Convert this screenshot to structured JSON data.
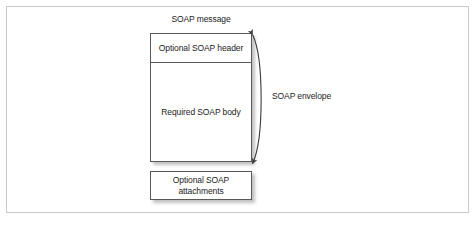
{
  "figure": {
    "title": "SOAP message",
    "side_label": "SOAP envelope",
    "boxes": {
      "header": "Optional SOAP header",
      "body": "Required SOAP body",
      "attachments_line1": "Optional SOAP",
      "attachments_line2": "attachments"
    },
    "colors": {
      "background": "#ffffff",
      "frame_border": "#c9c9c9",
      "box_border": "#58585a",
      "box_fill": "#ffffff",
      "text": "#1c1c1c",
      "shadow": "#9a9a9a",
      "arrow": "#3a3a3a"
    }
  }
}
